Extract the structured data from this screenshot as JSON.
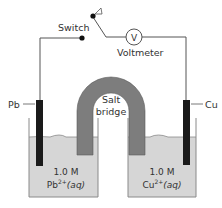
{
  "diagram": {
    "type": "galvanic-cell",
    "labels": {
      "switch": "Switch",
      "voltmeter": "Voltmeter",
      "voltmeter_symbol": "V",
      "salt_bridge_line1": "Salt",
      "salt_bridge_line2": "bridge",
      "left_electrode": "Pb",
      "right_electrode": "Cu",
      "left_concentration": "1.0 M",
      "left_species": "Pb",
      "left_charge": "2+",
      "left_state": "(aq)",
      "right_concentration": "1.0 M",
      "right_species": "Cu",
      "right_charge": "2+",
      "right_state": "(aq)"
    },
    "colors": {
      "wire": "#555555",
      "electrode": "#1a1a1a",
      "solution": "#d6d6d6",
      "beaker": "#888888",
      "salt_bridge": "#7d7d7d",
      "text": "#333333"
    }
  }
}
